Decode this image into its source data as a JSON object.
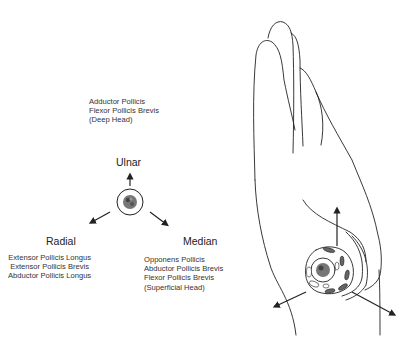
{
  "diagram": {
    "nerves": {
      "ulnar": {
        "label": "Ulnar",
        "muscles": [
          "Adductor Pollicis",
          "Flexor Pollicis Brevis",
          "(Deep Head)"
        ]
      },
      "radial": {
        "label": "Radial",
        "muscles": [
          "Extensor Pollicis Longus",
          "Extensor Pollicis Brevis",
          "Abductor Pollicis Longus"
        ]
      },
      "median": {
        "label": "Median",
        "muscles": [
          "Opponens Pollicis",
          "Abductor Pollicis Brevis",
          "Flexor Pollicis Brevis",
          "(Superficial Head)"
        ]
      }
    },
    "icons": {
      "center": "thumb-cross-section-icon",
      "hand": "hand-outline-icon"
    },
    "colors": {
      "line": "#222222",
      "background": "#ffffff"
    }
  }
}
